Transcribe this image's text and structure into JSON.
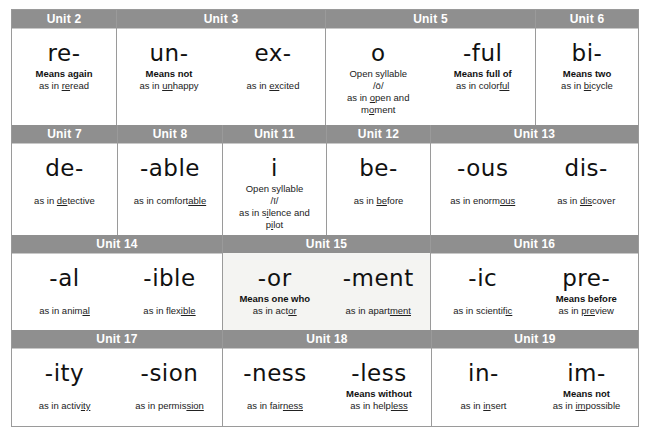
{
  "rows": [
    {
      "units": [
        {
          "title": "Unit 2",
          "cells": [
            {
              "affix": "re-",
              "meaning": "Means again",
              "example_pre": "as in ",
              "example_u": "re",
              "example_post": "read"
            }
          ]
        },
        {
          "title": "Unit 3",
          "cells": [
            {
              "affix": "un-",
              "meaning": "Means not",
              "example_pre": "as in ",
              "example_u": "un",
              "example_post": "happy"
            },
            {
              "affix": "ex-",
              "meaning": "",
              "example_pre": "as in ",
              "example_u": "ex",
              "example_post": "cited"
            }
          ]
        },
        {
          "title": "Unit 5",
          "cells": [
            {
              "affix": "o",
              "note1": "Open syllable",
              "note2": "/ō/",
              "example_pre": "as in ",
              "example_u": "o",
              "example_post": "pen and",
              "example2_pre": "m",
              "example2_u": "o",
              "example2_post": "ment"
            },
            {
              "affix": "-ful",
              "meaning": "Means full of",
              "example_pre": "as in color",
              "example_u": "ful",
              "example_post": ""
            }
          ]
        },
        {
          "title": "Unit 6",
          "cells": [
            {
              "affix": "bi-",
              "meaning": "Means two",
              "example_pre": "as in ",
              "example_u": "bi",
              "example_post": "cycle"
            }
          ]
        }
      ]
    },
    {
      "units": [
        {
          "title": "Unit 7",
          "cells": [
            {
              "affix": "de-",
              "meaning": "",
              "example_pre": "as in ",
              "example_u": "de",
              "example_post": "tective"
            }
          ]
        },
        {
          "title": "Unit 8",
          "cells": [
            {
              "affix": "-able",
              "meaning": "",
              "example_pre": "as in comfort",
              "example_u": "able",
              "example_post": ""
            }
          ]
        },
        {
          "title": "Unit 11",
          "cells": [
            {
              "affix": "i",
              "note1": "Open syllable",
              "note2": "/ī/",
              "example_pre": "as in s",
              "example_u": "i",
              "example_post": "lence and",
              "example2_pre": "p",
              "example2_u": "i",
              "example2_post": "lot"
            }
          ]
        },
        {
          "title": "Unit 12",
          "cells": [
            {
              "affix": "be-",
              "meaning": "",
              "example_pre": "as in ",
              "example_u": "be",
              "example_post": "fore"
            }
          ]
        },
        {
          "title": "Unit 13",
          "cells": [
            {
              "affix": "-ous",
              "meaning": "",
              "example_pre": "as in enorm",
              "example_u": "ous",
              "example_post": ""
            },
            {
              "affix": "dis-",
              "meaning": "",
              "example_pre": "as in ",
              "example_u": "dis",
              "example_post": "cover"
            }
          ]
        }
      ]
    },
    {
      "units": [
        {
          "title": "Unit 14",
          "cells": [
            {
              "affix": "-al",
              "meaning": "",
              "example_pre": "as in anim",
              "example_u": "al",
              "example_post": ""
            },
            {
              "affix": "-ible",
              "meaning": "",
              "example_pre": "as in flex",
              "example_u": "ible",
              "example_post": ""
            }
          ]
        },
        {
          "title": "Unit 15",
          "cells": [
            {
              "affix": "-or",
              "meaning": "Means one who",
              "example_pre": "as in act",
              "example_u": "or",
              "example_post": ""
            },
            {
              "affix": "-ment",
              "meaning": "",
              "example_pre": "as in apart",
              "example_u": "ment",
              "example_post": ""
            }
          ]
        },
        {
          "title": "Unit 16",
          "cells": [
            {
              "affix": "-ic",
              "meaning": "",
              "example_pre": "as in scientif",
              "example_u": "ic",
              "example_post": ""
            },
            {
              "affix": "pre-",
              "meaning": "Means before",
              "example_pre": "as in ",
              "example_u": "pre",
              "example_post": "view"
            }
          ]
        }
      ]
    },
    {
      "units": [
        {
          "title": "Unit 17",
          "cells": [
            {
              "affix": "-ity",
              "meaning": "",
              "example_pre": "as in activ",
              "example_u": "ity",
              "example_post": ""
            },
            {
              "affix": "-sion",
              "meaning": "",
              "example_pre": "as in permis",
              "example_u": "sion",
              "example_post": ""
            }
          ]
        },
        {
          "title": "Unit 18",
          "cells": [
            {
              "affix": "-ness",
              "meaning": "",
              "example_pre": "as in fair",
              "example_u": "ness",
              "example_post": ""
            },
            {
              "affix": "-less",
              "meaning": "Means without",
              "example_pre": "as in help",
              "example_u": "less",
              "example_post": ""
            }
          ]
        },
        {
          "title": "Unit 19",
          "cells": [
            {
              "affix": "in-",
              "meaning": "",
              "example_pre": "as in ",
              "example_u": "in",
              "example_post": "sert"
            },
            {
              "affix": "im-",
              "meaning": "Means not",
              "example_pre": "as in ",
              "example_u": "im",
              "example_post": "possible"
            }
          ]
        }
      ]
    }
  ],
  "colors": {
    "header_bg": "#8f8f8f",
    "header_text": "#ffffff",
    "border": "#9a9a9a",
    "shaded_cell": "#f4f4f2"
  }
}
